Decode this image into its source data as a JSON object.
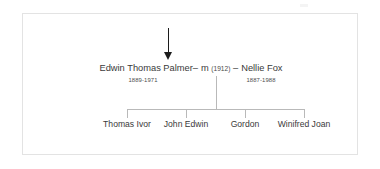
{
  "diagram": {
    "type": "family-tree",
    "colors": {
      "text": "#3a3a3a",
      "line": "#b9b9b9",
      "arrow": "#1c1c1c",
      "frame_border": "#e3e3e3",
      "background": "#ffffff"
    },
    "annotation_arrow": {
      "name": "down-arrow",
      "points_to": "Edwin Thomas Palmer"
    },
    "union": {
      "spouse_left": {
        "name": "Edwin Thomas Palmer",
        "dates": "1889-1971"
      },
      "spouse_right": {
        "name": "Nellie Fox",
        "dates": "1887-1988"
      },
      "marriage_symbol": "m",
      "marriage_year": "(1912)",
      "dash_left": "–",
      "dash_right": "–"
    },
    "children": [
      {
        "name": "Thomas Ivor",
        "bar_x": 126,
        "label_left": 86,
        "label_width": 80
      },
      {
        "name": "John Edwin",
        "bar_x": 185,
        "label_left": 145,
        "label_width": 80
      },
      {
        "name": "Gordon",
        "bar_x": 244,
        "label_left": 204,
        "label_width": 80
      },
      {
        "name": "Winifred Joan",
        "bar_x": 303,
        "label_left": 263,
        "label_width": 80
      }
    ]
  }
}
